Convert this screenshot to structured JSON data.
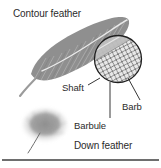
{
  "figure": {
    "background_color": "#ffffff",
    "ink_color": "#2b2b2b",
    "feather_gray": "#8f8f8f",
    "down_gray": "#9a9a9a",
    "baseline_color": "#6e6e6e"
  },
  "labels": {
    "contour_feather": "Contour feather",
    "shaft": "Shaft",
    "barb": "Barb",
    "barbule": "Barbule",
    "down_feather": "Down feather"
  },
  "icons": {
    "contour_feather": "contour-feather-illustration",
    "down_feather": "down-feather-illustration",
    "magnifier_circle": "magnified-inset-circle",
    "baseline_rule": "horizontal-rule"
  },
  "leader_lines": [
    {
      "name": "shaft-leader",
      "from": [
        99,
        77
      ],
      "to": [
        88,
        84
      ]
    },
    {
      "name": "barbule-leader",
      "from": [
        110,
        84
      ],
      "to": [
        110,
        117
      ]
    },
    {
      "name": "barb-leader",
      "from": [
        128,
        79
      ],
      "to": [
        140,
        100
      ]
    }
  ]
}
